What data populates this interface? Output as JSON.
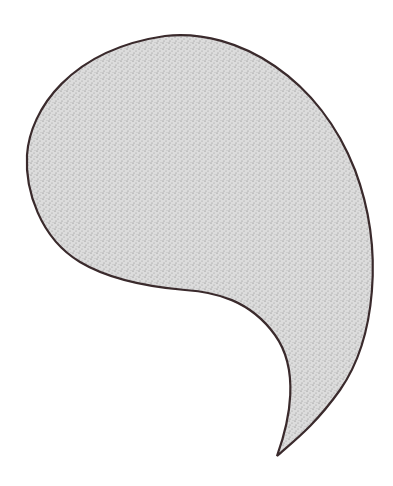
{
  "figure": {
    "colors": {
      "background": "#ffffff",
      "outline": "#3a2a2c",
      "fill": "#d4d4d4",
      "stipple": "#6e6e6e"
    }
  }
}
